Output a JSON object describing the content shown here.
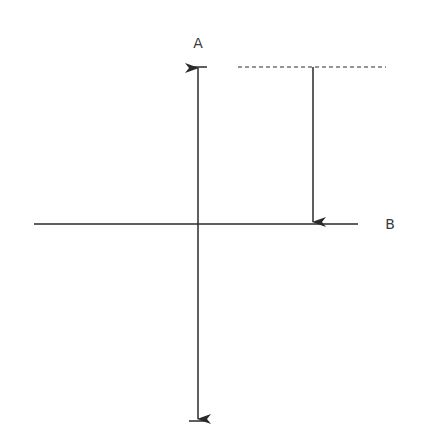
{
  "diagram": {
    "labels": {
      "a": "A",
      "b": "B"
    },
    "colors": {
      "line": "#2a2a2a",
      "background": "#ffffff"
    },
    "elements": [
      {
        "name": "vertical-axis",
        "type": "double-arrow",
        "from": [
          198,
          67
        ],
        "to": [
          198,
          420
        ]
      },
      {
        "name": "horizontal-axis",
        "type": "line",
        "from": [
          34,
          224
        ],
        "to": [
          358,
          224
        ]
      },
      {
        "name": "dashed-reference-line",
        "type": "dashed-line",
        "from": [
          238,
          67
        ],
        "to": [
          386,
          67
        ]
      },
      {
        "name": "drop-arrow",
        "type": "arrow",
        "from": [
          313,
          67
        ],
        "to": [
          313,
          223
        ]
      }
    ]
  }
}
